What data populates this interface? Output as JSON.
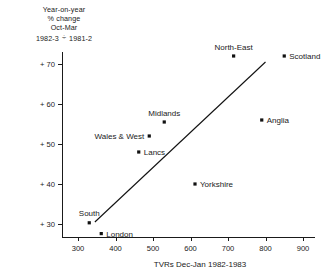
{
  "caption": {
    "line1": "Year-on-year",
    "line2": "% change",
    "line3": "Oct-Mar",
    "numerator": "1982-3",
    "separator": "÷",
    "denominator": "1981-2"
  },
  "chart_data": {
    "type": "scatter",
    "title": "",
    "xlabel": "TVRs Dec-Jan 1982-1983",
    "ylabel": "Year-on-year % change Oct-Mar 1982-3 ÷ 1981-2",
    "xlim": [
      250,
      920
    ],
    "ylim": [
      26,
      76
    ],
    "xticks": [
      300,
      400,
      500,
      600,
      700,
      800,
      900
    ],
    "xtick_labels": [
      "300",
      "400",
      "500",
      "600",
      "700",
      "800",
      "900"
    ],
    "yticks": [
      30,
      40,
      50,
      60,
      70
    ],
    "ytick_labels": [
      "+ 30",
      "+ 40",
      "+ 50",
      "+ 60",
      "+ 70"
    ],
    "grid": false,
    "legend": false,
    "points": [
      {
        "label": "Scotland",
        "x": 850,
        "y": 72.0,
        "label_pos": "right"
      },
      {
        "label": "North-East",
        "x": 715,
        "y": 72.0,
        "label_pos": "above"
      },
      {
        "label": "Anglia",
        "x": 790,
        "y": 56.0,
        "label_pos": "right"
      },
      {
        "label": "Midlands",
        "x": 530,
        "y": 55.5,
        "label_pos": "above"
      },
      {
        "label": "Wales & West",
        "x": 490,
        "y": 52.0,
        "label_pos": "left"
      },
      {
        "label": "Lancs",
        "x": 462,
        "y": 48.0,
        "label_pos": "right"
      },
      {
        "label": "Yorkshire",
        "x": 612,
        "y": 40.0,
        "label_pos": "right"
      },
      {
        "label": "South",
        "x": 330,
        "y": 30.3,
        "label_pos": "above"
      },
      {
        "label": "London",
        "x": 362,
        "y": 27.6,
        "label_pos": "right"
      }
    ],
    "trend_line": {
      "x_start": 345,
      "y_start": 30.5,
      "x_end": 800,
      "y_end": 70.5
    }
  }
}
